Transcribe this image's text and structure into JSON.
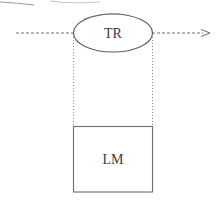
{
  "diagram": {
    "nodes": [
      {
        "id": "tr",
        "label": "TR",
        "shape": "ellipse"
      },
      {
        "id": "lm",
        "label": "LM",
        "shape": "rectangle"
      }
    ],
    "edges": [
      {
        "from": "left",
        "to": "tr",
        "style": "dashed"
      },
      {
        "from": "tr",
        "to": "right",
        "style": "dashed-arrow"
      },
      {
        "from": "tr",
        "to": "lm",
        "style": "dotted-vertical-guides"
      }
    ],
    "colors": {
      "stroke": "#6e6e6e",
      "text": "#3a3a3a",
      "background": "#ffffff"
    }
  }
}
